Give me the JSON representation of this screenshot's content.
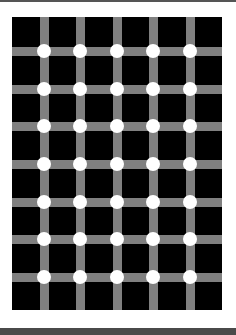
{
  "image": {
    "subject": "Scintillating grid optical illusion",
    "background_color": "#ffffff",
    "square_color": "#000000",
    "bar_color": "#808080",
    "dot_color": "#ffffff",
    "frame_top_color": "#555555",
    "frame_bottom_color": "#4a4a4a"
  },
  "grid": {
    "columns_of_dots": 5,
    "rows_of_dots": 7,
    "dot_x": [
      32,
      68,
      105,
      141,
      178
    ],
    "dot_y": [
      34,
      72,
      109,
      147,
      185,
      222,
      260
    ]
  }
}
